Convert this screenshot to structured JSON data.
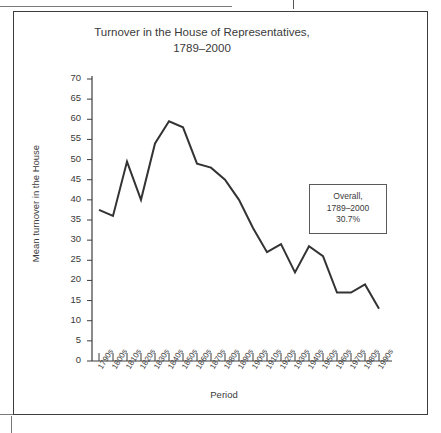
{
  "figure": {
    "title": "Turnover in the House of Representatives,\n1789–2000",
    "annotation": "Overall,\n1789–2000\n30.7%"
  },
  "chart_data": {
    "type": "line",
    "title": "Turnover in the House of Representatives, 1789–2000",
    "xlabel": "Period",
    "ylabel": "Mean turnover in the House",
    "ylim": [
      0,
      70
    ],
    "ytick_step": 5,
    "yticks": [
      0,
      5,
      10,
      15,
      20,
      25,
      30,
      35,
      40,
      45,
      50,
      55,
      60,
      65,
      70
    ],
    "grid": false,
    "legend": false,
    "line_color": "#333333",
    "categories": [
      "1790s",
      "1800s",
      "1810s",
      "1820s",
      "1830s",
      "1840s",
      "1850s",
      "1860s",
      "1870s",
      "1880s",
      "1890s",
      "1900s",
      "1910s",
      "1920s",
      "1930s",
      "1940s",
      "1950s",
      "1960s",
      "1970s",
      "1980s",
      "1990s"
    ],
    "values": [
      37.5,
      36.0,
      49.5,
      40.0,
      54.0,
      59.5,
      58.0,
      49.0,
      48.0,
      45.0,
      40.0,
      33.0,
      27.0,
      29.0,
      22.0,
      28.5,
      26.0,
      17.0,
      17.0,
      19.0,
      13.0
    ],
    "annotations": [
      {
        "text": "Overall, 1789–2000 30.7%",
        "value": 30.7
      }
    ]
  }
}
